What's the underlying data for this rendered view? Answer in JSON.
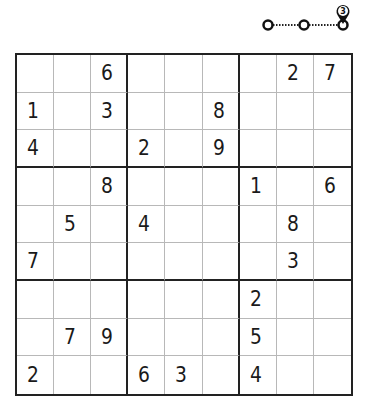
{
  "progress": {
    "current_step": "3",
    "total_nodes": 3,
    "marker_icon": "location-pin-icon"
  },
  "puzzle": {
    "type": "sudoku",
    "size": 9,
    "rows": [
      [
        "",
        "",
        "6",
        "",
        "",
        "",
        "",
        "2",
        "7"
      ],
      [
        "1",
        "",
        "3",
        "",
        "",
        "8",
        "",
        "",
        ""
      ],
      [
        "4",
        "",
        "",
        "2",
        "",
        "9",
        "",
        "",
        ""
      ],
      [
        "",
        "",
        "8",
        "",
        "",
        "",
        "1",
        "",
        "6"
      ],
      [
        "",
        "5",
        "",
        "4",
        "",
        "",
        "",
        "8",
        ""
      ],
      [
        "7",
        "",
        "",
        "",
        "",
        "",
        "",
        "3",
        ""
      ],
      [
        "",
        "",
        "",
        "",
        "",
        "",
        "2",
        "",
        ""
      ],
      [
        "",
        "7",
        "9",
        "",
        "",
        "",
        "5",
        "",
        ""
      ],
      [
        "2",
        "",
        "",
        "6",
        "3",
        "",
        "4",
        "",
        ""
      ]
    ]
  },
  "colors": {
    "line_thick": "#222222",
    "line_thin": "#b8b8b8",
    "digit": "#1a1a1a",
    "background": "#ffffff"
  }
}
